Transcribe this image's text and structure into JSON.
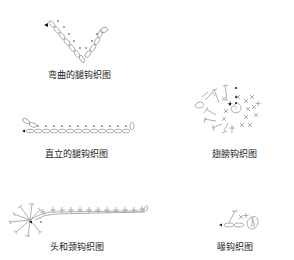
{
  "diagrams": [
    {
      "id": "bent-leg",
      "caption": "弯曲的腿钩织图"
    },
    {
      "id": "straight-leg",
      "caption": "直立的腿钩织图"
    },
    {
      "id": "wing",
      "caption": "翅膀钩织图"
    },
    {
      "id": "head-neck",
      "caption": "头和颈钩织图"
    },
    {
      "id": "beak",
      "caption": "喙钩织图"
    }
  ],
  "colors": {
    "stitch": "#9a9a9a",
    "marker": "#111111",
    "text": "#222222",
    "background": "#ffffff"
  }
}
